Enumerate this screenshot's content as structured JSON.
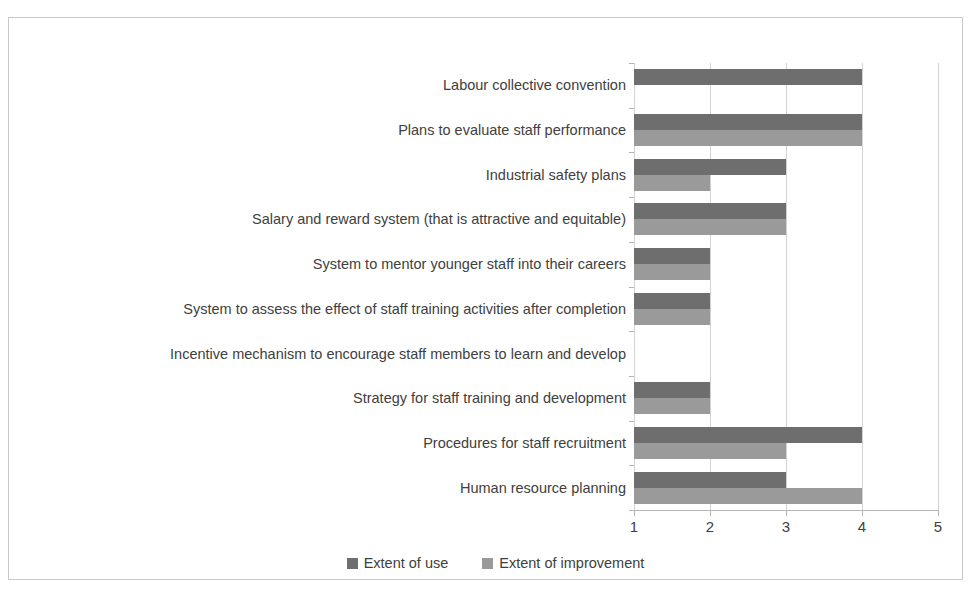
{
  "chart_data": {
    "type": "bar",
    "orientation": "horizontal",
    "title": "",
    "subtitle": "",
    "xlabel": "",
    "ylabel": "",
    "xlim": [
      1,
      5
    ],
    "xticks": [
      "1",
      "2",
      "3",
      "4",
      "5"
    ],
    "grid": true,
    "legend_position": "bottom",
    "categories": [
      "Labour collective convention",
      "Plans to evaluate staff performance",
      "Industrial safety plans",
      "Salary and reward system (that is attractive and equitable)",
      "System to mentor younger staff into their careers",
      "System to assess the effect of staff training activities after completion",
      "Incentive mechanism to encourage staff members to learn and develop",
      "Strategy for staff training and development",
      "Procedures for staff recruitment",
      "Human resource planning"
    ],
    "series": [
      {
        "name": "Extent of use",
        "color": "#6e6e6e",
        "values": [
          4,
          4,
          3,
          3,
          2,
          2,
          1,
          2,
          4,
          3
        ]
      },
      {
        "name": "Extent of improvement",
        "color": "#9a9a9a",
        "values": [
          1,
          4,
          2,
          3,
          2,
          2,
          1,
          2,
          3,
          4
        ]
      }
    ]
  },
  "legend": {
    "items": [
      {
        "label": "Extent of use",
        "color": "#6e6e6e"
      },
      {
        "label": "Extent of improvement",
        "color": "#9a9a9a"
      }
    ]
  },
  "axis": {
    "x_tick_labels": [
      "1",
      "2",
      "3",
      "4",
      "5"
    ]
  }
}
